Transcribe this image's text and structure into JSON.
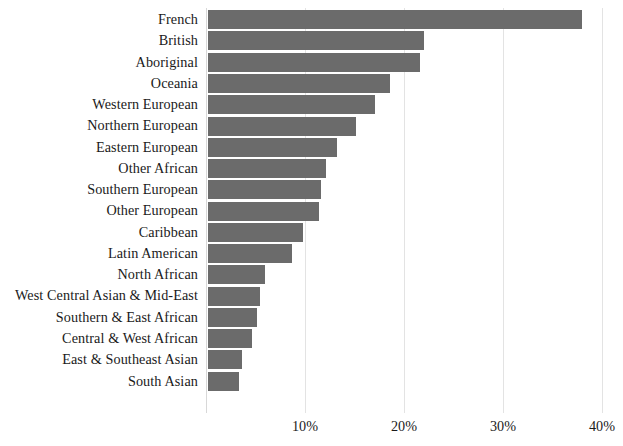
{
  "chart_data": {
    "type": "bar",
    "orientation": "horizontal",
    "title": "",
    "subtitle": "",
    "xlabel": "",
    "ylabel": "",
    "xlim": [
      0,
      40
    ],
    "xticks": [
      10,
      20,
      30,
      40
    ],
    "xtick_labels": [
      "10%",
      "20%",
      "30%",
      "40%"
    ],
    "grid": "vertical",
    "legend": "none",
    "value_unit": "percent",
    "bar_color": "#6b6b6b",
    "gridline_color": "#e3e3e3",
    "axis_color": "#d8d8d8",
    "text_color": "#1a1a1a",
    "background_color": "#ffffff",
    "categories": [
      "French",
      "British",
      "Aboriginal",
      "Oceania",
      "Western European",
      "Northern European",
      "Eastern European",
      "Other African",
      "Southern European",
      "Other European",
      "Caribbean",
      "Latin American",
      "North African",
      "West Central Asian & Mid-East",
      "Southern & East African",
      "Central & West African",
      "East & Southeast Asian",
      "South Asian"
    ],
    "values": [
      37.8,
      21.8,
      21.4,
      18.4,
      16.9,
      14.9,
      13.0,
      11.9,
      11.4,
      11.2,
      9.6,
      8.5,
      5.8,
      5.3,
      4.9,
      4.4,
      3.4,
      3.1
    ]
  }
}
